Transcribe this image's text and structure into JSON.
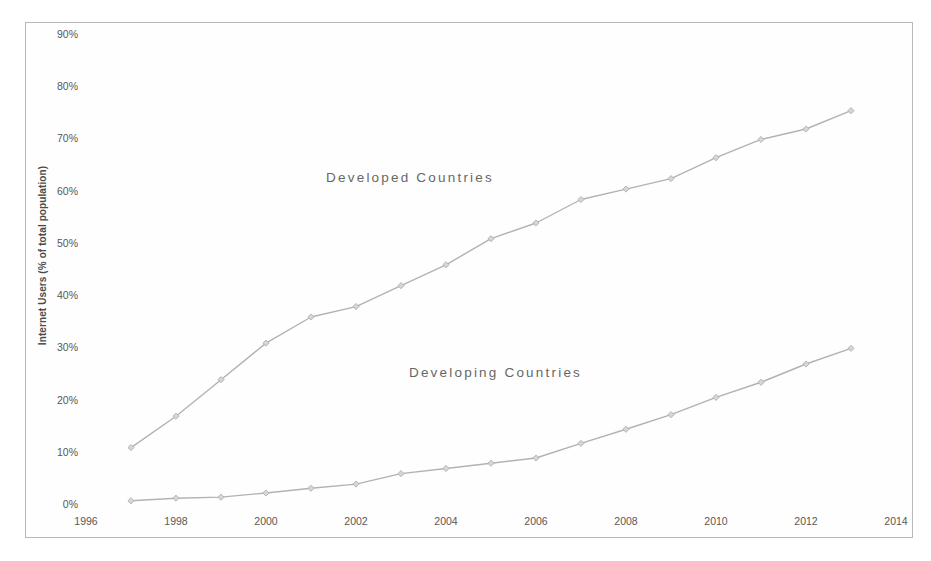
{
  "figure": {
    "background_color": "#ffffff",
    "frame_border_color": "#b9b9b9",
    "line_color": "#b2b2b2",
    "marker_color": "#d6d6d6",
    "marker_edge_color": "#ababab",
    "text_color": "#4a4a4a"
  },
  "chart_data": {
    "type": "line",
    "title": "",
    "xlabel": "",
    "ylabel": "Internet Users (% of total population)",
    "xlim": [
      1996,
      2014
    ],
    "ylim": [
      0,
      90
    ],
    "grid": false,
    "legend_position": "inline-annotation",
    "x_tick_labels": [
      "1996",
      "1998",
      "2000",
      "2002",
      "2004",
      "2006",
      "2008",
      "2010",
      "2012",
      "2014"
    ],
    "x_ticks": [
      1996,
      1998,
      2000,
      2002,
      2004,
      2006,
      2008,
      2010,
      2012,
      2014
    ],
    "y_tick_labels": [
      "0%",
      "10%",
      "20%",
      "30%",
      "40%",
      "50%",
      "60%",
      "70%",
      "80%",
      "90%"
    ],
    "y_ticks": [
      0,
      10,
      20,
      30,
      40,
      50,
      60,
      70,
      80,
      90
    ],
    "x": [
      1997,
      1998,
      1999,
      2000,
      2001,
      2002,
      2003,
      2004,
      2005,
      2006,
      2007,
      2008,
      2009,
      2010,
      2011,
      2012,
      2013
    ],
    "series": [
      {
        "name": "Developed Countries",
        "label_text": "Developed Countries",
        "label_x": 2003.2,
        "label_y": 62.5,
        "values": [
          11.0,
          17.0,
          24.0,
          31.0,
          36.0,
          38.0,
          42.0,
          46.0,
          51.0,
          54.0,
          58.5,
          60.5,
          62.5,
          66.5,
          70.0,
          72.0,
          75.5
        ]
      },
      {
        "name": "Developing Countries",
        "label_text": "Developing Countries",
        "label_x": 2005.1,
        "label_y": 25.0,
        "values": [
          0.8,
          1.3,
          1.5,
          2.3,
          3.2,
          4.0,
          6.0,
          7.0,
          8.0,
          9.0,
          11.8,
          14.5,
          17.3,
          20.6,
          23.5,
          27.0,
          30.0
        ]
      }
    ]
  }
}
